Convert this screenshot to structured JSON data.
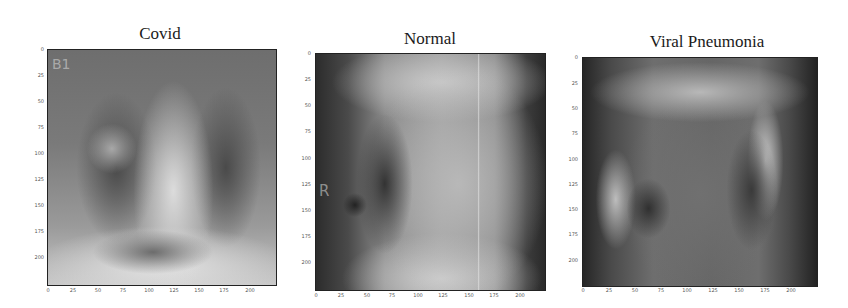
{
  "figure": {
    "panels": [
      {
        "title": "Covid",
        "overlay_label": "B1",
        "yticks": [
          "0",
          "25",
          "50",
          "75",
          "100",
          "125",
          "150",
          "175",
          "200"
        ],
        "xticks": [
          "0",
          "25",
          "50",
          "75",
          "100",
          "125",
          "150",
          "175",
          "200"
        ],
        "extent": [
          0,
          224
        ]
      },
      {
        "title": "Normal",
        "overlay_label": "R",
        "yticks": [
          "0",
          "25",
          "50",
          "75",
          "100",
          "125",
          "150",
          "175",
          "200"
        ],
        "xticks": [
          "0",
          "25",
          "50",
          "75",
          "100",
          "125",
          "150",
          "175",
          "200"
        ],
        "extent": [
          0,
          224
        ]
      },
      {
        "title": "Viral Pneumonia",
        "overlay_label": "",
        "yticks": [
          "0",
          "25",
          "50",
          "75",
          "100",
          "125",
          "150",
          "175",
          "200"
        ],
        "xticks": [
          "0",
          "25",
          "50",
          "75",
          "100",
          "125",
          "150",
          "175",
          "200"
        ],
        "extent": [
          0,
          224
        ]
      }
    ]
  }
}
